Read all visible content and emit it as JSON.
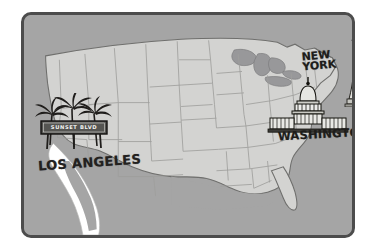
{
  "map": {
    "title": "United States landmark map",
    "frame_color": "#4c4c4c",
    "ocean_color": "#a5a5a5",
    "land_color": "#d2d2d0",
    "lakes_color": "#9a9a9a",
    "border_line_color": "#9b9b99",
    "background_color": "#ffffff"
  },
  "markers": {
    "los_angeles": {
      "city_label": "LOS ANGELES",
      "sign_text": "SUNSET BLVD",
      "icon_palm": "palm-tree-icon",
      "icon_sign": "street-sign-icon"
    },
    "washington": {
      "city_label": "WASHINGTON",
      "icon_capitol": "capitol-building-icon"
    },
    "new_york": {
      "city_label_line1": "NEW",
      "city_label_line2": "YORK",
      "icon_liberty": "statue-of-liberty-icon"
    }
  }
}
